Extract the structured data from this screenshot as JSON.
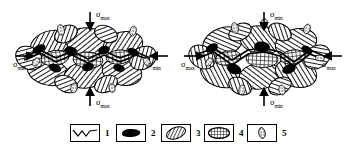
{
  "figure": {
    "type": "materials-microstructure-diagram"
  },
  "diagrams": [
    {
      "id": "left",
      "name": "minimum-stress-state",
      "stress_labels": {
        "top": {
          "symbol": "σ",
          "subscript": "max",
          "arrow": "down"
        },
        "bottom": {
          "symbol": "σ",
          "subscript": "max",
          "arrow": "up"
        },
        "left": {
          "symbol": "σ",
          "subscript": "min",
          "arrow": "right"
        },
        "right": {
          "symbol": "σ",
          "subscript": "min",
          "arrow": "left"
        }
      }
    },
    {
      "id": "right",
      "name": "maximum-stress-state",
      "stress_labels": {
        "top": {
          "symbol": "σ",
          "subscript": "min",
          "arrow": "down"
        },
        "bottom": {
          "symbol": "σ",
          "subscript": "min",
          "arrow": "up"
        },
        "left": {
          "symbol": "σ",
          "subscript": "max",
          "arrow": "right"
        },
        "right": {
          "symbol": "σ",
          "subscript": "max",
          "arrow": "left"
        }
      }
    }
  ],
  "legend": {
    "items": [
      {
        "number": "1",
        "icon": "zigzag-line-icon",
        "pattern": "zigzag-line"
      },
      {
        "number": "2",
        "icon": "solid-black-blob-icon",
        "pattern": "solid-black"
      },
      {
        "number": "3",
        "icon": "diagonal-hatch-blob-icon",
        "pattern": "diagonal-hatch"
      },
      {
        "number": "4",
        "icon": "cross-hatch-ellipse-icon",
        "pattern": "cross-hatch"
      },
      {
        "number": "5",
        "icon": "stippled-sliver-icon",
        "pattern": "stipple"
      }
    ]
  },
  "colors": {
    "ink": "#000000",
    "background": "#ffffff",
    "hatch": "#2b2b2b",
    "grain_fill": "#e8e8e8"
  }
}
